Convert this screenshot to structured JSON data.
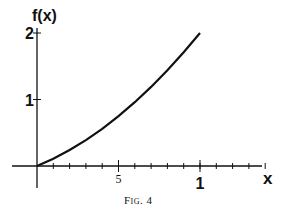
{
  "chart_data": {
    "type": "line",
    "title": "",
    "caption": "Fig. 4",
    "xlabel": "x",
    "ylabel": "f(x)",
    "xlim": [
      0,
      1.4
    ],
    "ylim": [
      0,
      2
    ],
    "x_major_ticks": [
      {
        "value": 0.5,
        "label": "5"
      },
      {
        "value": 1,
        "label": "1"
      }
    ],
    "x_minor_tick_step": 0.1,
    "y_ticks": [
      {
        "value": 1,
        "label": "1"
      },
      {
        "value": 2,
        "label": "2"
      }
    ],
    "grid": false,
    "series": [
      {
        "name": "f(x)",
        "x": [
          0,
          0.1,
          0.2,
          0.3,
          0.4,
          0.5,
          0.6,
          0.7,
          0.8,
          0.9,
          1.0
        ],
        "y": [
          0,
          0.11,
          0.24,
          0.39,
          0.56,
          0.75,
          0.96,
          1.19,
          1.44,
          1.71,
          2.0
        ]
      }
    ]
  }
}
